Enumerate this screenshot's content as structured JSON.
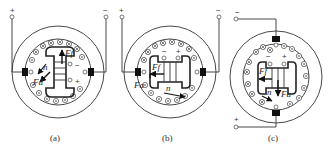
{
  "figure": {
    "panels": [
      {
        "id": "a",
        "caption": "(a)",
        "terminals": {
          "left": "+",
          "right": "−"
        },
        "brush_signs": {
          "upper": "−",
          "lower": "+"
        },
        "labels": {
          "field": "Ff",
          "armature": "Fa",
          "speed": "n"
        }
      },
      {
        "id": "b",
        "caption": "(b)",
        "terminals": {
          "left": "+",
          "right": "−"
        },
        "brush_signs": {
          "left": "−",
          "right": "+"
        },
        "labels": {
          "field": "Ff",
          "armature": "Fa",
          "speed": "n"
        }
      },
      {
        "id": "c",
        "caption": "(c)",
        "terminals": {
          "top": "−",
          "bottom": "+"
        },
        "brush_signs": {
          "left": "−",
          "right": "+"
        },
        "labels": {
          "field": "Ff",
          "armature": "Fa",
          "speed": "n"
        }
      }
    ]
  }
}
